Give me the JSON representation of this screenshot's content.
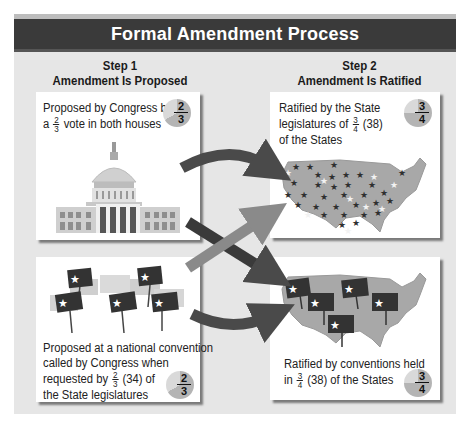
{
  "title": "Formal Amendment Process",
  "steps": [
    {
      "label": "Step 1",
      "subtitle": "Amendment Is Proposed"
    },
    {
      "label": "Step 2",
      "subtitle": "Amendment Is Ratified"
    }
  ],
  "boxes": {
    "proposed_congress": {
      "line1": "Proposed by Congress by",
      "line2_prefix": "a",
      "fraction": {
        "num": "2",
        "den": "3"
      },
      "line2_suffix": "vote in both houses",
      "pie": {
        "num": "2",
        "den": "3"
      },
      "illustration": "capitol-building"
    },
    "ratified_legislatures": {
      "line1": "Ratified by the State",
      "line2_prefix": "legislatures of",
      "fraction": {
        "num": "3",
        "den": "4"
      },
      "line2_suffix": "(38)",
      "line3": "of the States",
      "pie": {
        "num": "3",
        "den": "4"
      },
      "illustration": "us-map-with-stars"
    },
    "proposed_convention": {
      "line1": "Proposed at a national convention",
      "line2": "called by Congress when",
      "line3_prefix": "requested by",
      "fraction": {
        "num": "2",
        "den": "3"
      },
      "line3_suffix": "(34) of",
      "line4": "the State legislatures",
      "pie": {
        "num": "2",
        "den": "3"
      },
      "illustration": "convention-signs"
    },
    "ratified_conventions": {
      "line1": "Ratified by conventions held",
      "line2_prefix": "in",
      "fraction": {
        "num": "3",
        "den": "4"
      },
      "line2_suffix": "(38) of the States",
      "pie": {
        "num": "3",
        "den": "4"
      },
      "illustration": "us-map-with-signs"
    }
  },
  "colors": {
    "title_bg": "#3a3a3a",
    "panel_bg": "#e6e6e6",
    "pie_light": "#d9d9d9",
    "pie_dark": "#b4b4b4",
    "map_fill": "#a8a8a8",
    "arrow_dark": "#4a4a4a",
    "arrow_light": "#8a8a8a"
  }
}
